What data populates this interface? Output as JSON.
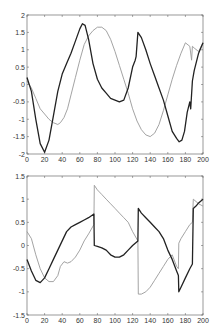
{
  "chart_data": [
    {
      "type": "line",
      "title": "",
      "xlabel": "",
      "ylabel": "",
      "xlim": [
        0,
        200
      ],
      "ylim": [
        -2,
        2
      ],
      "grid": false,
      "legend": null,
      "x_ticks": [
        0,
        20,
        40,
        60,
        80,
        100,
        120,
        140,
        160,
        180,
        200
      ],
      "y_ticks": [
        -2,
        -1.5,
        -1,
        -0.5,
        0,
        0.5,
        1,
        1.5,
        2
      ],
      "x_tick_labels": [
        "0",
        "20",
        "40",
        "60",
        "80",
        "100",
        "120",
        "140",
        "160",
        "180",
        "200"
      ],
      "y_tick_labels": [
        "-2",
        "-1.5",
        "-1",
        "-0.5",
        "0",
        "0.5",
        "1",
        "1.5",
        "2"
      ],
      "series": [
        {
          "name": "dark",
          "color": "#222222",
          "x": [
            0,
            5,
            10,
            15,
            20,
            25,
            30,
            35,
            40,
            45,
            50,
            55,
            60,
            63,
            66,
            70,
            75,
            80,
            85,
            90,
            95,
            100,
            105,
            110,
            115,
            120,
            123,
            124,
            126,
            130,
            135,
            140,
            145,
            150,
            155,
            160,
            165,
            170,
            173,
            176,
            179,
            182,
            185,
            186,
            188,
            190,
            195,
            200
          ],
          "y": [
            0.2,
            -0.2,
            -1.0,
            -1.7,
            -1.95,
            -1.6,
            -0.9,
            -0.2,
            0.3,
            0.6,
            0.9,
            1.25,
            1.6,
            1.75,
            1.7,
            1.3,
            0.6,
            0.15,
            -0.1,
            -0.25,
            -0.4,
            -0.45,
            -0.5,
            -0.45,
            -0.1,
            0.5,
            0.7,
            0.8,
            1.5,
            1.35,
            1.0,
            0.6,
            0.25,
            -0.1,
            -0.45,
            -0.9,
            -1.35,
            -1.55,
            -1.65,
            -1.6,
            -1.35,
            -0.8,
            -0.5,
            -0.7,
            0.1,
            0.4,
            0.9,
            1.2
          ]
        },
        {
          "name": "light",
          "color": "#999999",
          "x": [
            0,
            5,
            10,
            15,
            20,
            25,
            30,
            35,
            38,
            42,
            46,
            50,
            55,
            60,
            65,
            70,
            75,
            80,
            85,
            90,
            95,
            100,
            105,
            110,
            115,
            120,
            125,
            130,
            135,
            140,
            145,
            150,
            155,
            160,
            165,
            170,
            175,
            180,
            185,
            187,
            188,
            190,
            195,
            200
          ],
          "y": [
            0.1,
            -0.1,
            -0.4,
            -0.7,
            -0.85,
            -1.0,
            -1.1,
            -1.15,
            -1.1,
            -0.95,
            -0.7,
            -0.3,
            0.2,
            0.7,
            1.15,
            1.4,
            1.55,
            1.65,
            1.65,
            1.55,
            1.3,
            0.95,
            0.55,
            0.15,
            -0.25,
            -0.7,
            -1.05,
            -1.3,
            -1.45,
            -1.5,
            -1.4,
            -1.15,
            -0.75,
            -0.3,
            0.15,
            0.55,
            0.9,
            1.2,
            1.1,
            0.7,
            1.1,
            1.05,
            0.95,
            1.2
          ]
        }
      ]
    },
    {
      "type": "line",
      "title": "",
      "xlabel": "",
      "ylabel": "",
      "xlim": [
        0,
        200
      ],
      "ylim": [
        -1.5,
        1.5
      ],
      "grid": false,
      "legend": null,
      "x_ticks": [
        0,
        20,
        40,
        60,
        80,
        100,
        120,
        140,
        160,
        180,
        200
      ],
      "y_ticks": [
        -1.5,
        -1,
        -0.5,
        0,
        0.5,
        1,
        1.5
      ],
      "x_tick_labels": [
        "0",
        "20",
        "40",
        "60",
        "80",
        "100",
        "120",
        "140",
        "160",
        "180",
        "200"
      ],
      "y_tick_labels": [
        "-1.5",
        "-1",
        "-0.5",
        "0",
        "0.5",
        "1",
        "1.5"
      ],
      "series": [
        {
          "name": "dark",
          "color": "#222222",
          "x": [
            0,
            5,
            10,
            15,
            20,
            25,
            30,
            35,
            40,
            45,
            50,
            55,
            60,
            65,
            70,
            76,
            76.5,
            80,
            85,
            90,
            95,
            100,
            105,
            110,
            115,
            120,
            126,
            126.5,
            130,
            135,
            140,
            145,
            150,
            155,
            160,
            165,
            170,
            172,
            172.5,
            175,
            180,
            185,
            188,
            189,
            192,
            195,
            200
          ],
          "y": [
            -0.3,
            -0.55,
            -0.75,
            -0.8,
            -0.7,
            -0.5,
            -0.3,
            -0.1,
            0.1,
            0.3,
            0.4,
            0.45,
            0.5,
            0.55,
            0.6,
            0.68,
            0.0,
            -0.02,
            -0.05,
            -0.1,
            -0.2,
            -0.25,
            -0.25,
            -0.2,
            -0.1,
            0.0,
            0.1,
            0.8,
            0.7,
            0.6,
            0.5,
            0.4,
            0.3,
            0.15,
            -0.1,
            -0.3,
            -0.55,
            -0.65,
            -1.0,
            -0.9,
            -0.7,
            -0.5,
            -0.4,
            0.8,
            0.85,
            0.92,
            1.0
          ]
        },
        {
          "name": "light",
          "color": "#999999",
          "x": [
            0,
            5,
            10,
            15,
            20,
            25,
            30,
            35,
            38,
            42,
            46,
            50,
            55,
            60,
            65,
            70,
            76,
            76.5,
            80,
            85,
            90,
            95,
            100,
            105,
            110,
            115,
            120,
            126,
            126.5,
            130,
            135,
            140,
            145,
            150,
            155,
            160,
            165,
            170,
            172,
            172.5,
            175,
            180,
            185,
            188,
            189,
            192,
            195,
            200
          ],
          "y": [
            0.3,
            0.15,
            -0.2,
            -0.5,
            -0.7,
            -0.78,
            -0.78,
            -0.65,
            -0.45,
            -0.35,
            -0.38,
            -0.35,
            -0.25,
            -0.1,
            0.1,
            0.25,
            0.45,
            1.3,
            1.2,
            1.1,
            1.0,
            0.9,
            0.8,
            0.7,
            0.6,
            0.5,
            0.3,
            0.1,
            -1.05,
            -1.05,
            -1.0,
            -0.9,
            -0.75,
            -0.6,
            -0.45,
            -0.3,
            -0.2,
            -0.45,
            -0.5,
            0.05,
            0.15,
            0.3,
            0.45,
            0.5,
            1.0,
            0.95,
            0.9,
            0.85
          ]
        }
      ]
    }
  ]
}
